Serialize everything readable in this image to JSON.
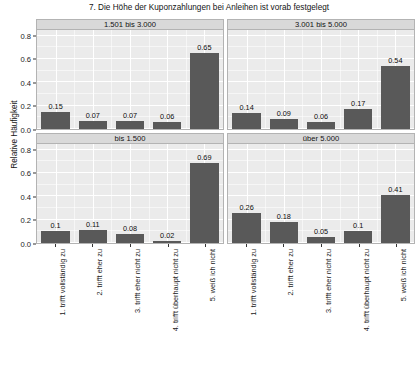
{
  "chart_data": {
    "type": "bar",
    "title": "7. Die Höhe der Kuponzahlungen bei Anleihen ist vorab festgelegt",
    "xlabel": "",
    "ylabel": "Relative Häufigkeit",
    "ylim": [
      0,
      0.85
    ],
    "yticks": [
      "0.0",
      "0.2",
      "0.4",
      "0.6",
      "0.8"
    ],
    "ytick_values": [
      0.0,
      0.2,
      0.4,
      0.6,
      0.8
    ],
    "grid": true,
    "legend": "none",
    "bar_color": "#595959",
    "panel_background": "#ebebeb",
    "strip_background": "#d9d9d9",
    "gridline_color": "#ffffff",
    "categories": [
      "1. trifft vollständig zu",
      "2. trifft eher zu",
      "3. trifft eher nicht zu",
      "4. trifft überhaupt nicht zu",
      "5. weiß ich nicht"
    ],
    "facet_layout": "2x2",
    "panels": [
      {
        "id": "panel-1501-3000",
        "label": "1.501 bis 3.000",
        "values": [
          0.15,
          0.07,
          0.07,
          0.06,
          0.65
        ],
        "value_labels": [
          "0.15",
          "0.07",
          "0.07",
          "0.06",
          "0.65"
        ]
      },
      {
        "id": "panel-3001-5000",
        "label": "3.001 bis 5.000",
        "values": [
          0.14,
          0.09,
          0.06,
          0.17,
          0.54
        ],
        "value_labels": [
          "0.14",
          "0.09",
          "0.06",
          "0.17",
          "0.54"
        ]
      },
      {
        "id": "panel-bis-1500",
        "label": "bis 1.500",
        "values": [
          0.1,
          0.11,
          0.08,
          0.02,
          0.69
        ],
        "value_labels": [
          "0.1",
          "0.11",
          "0.08",
          "0.02",
          "0.69"
        ]
      },
      {
        "id": "panel-ueber-5000",
        "label": "über 5.000",
        "values": [
          0.26,
          0.18,
          0.05,
          0.1,
          0.41
        ],
        "value_labels": [
          "0.26",
          "0.18",
          "0.05",
          "0.1",
          "0.41"
        ]
      }
    ]
  }
}
